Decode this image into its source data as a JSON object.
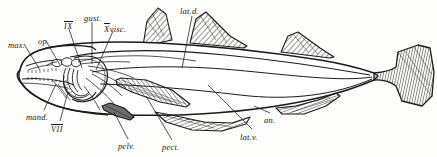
{
  "figure": {
    "background_color": "#fdfdfc",
    "ink_color": "#181818",
    "hatch_color": "#4a4a4a"
  },
  "labels": [
    {
      "id": "max",
      "text": "max.",
      "x": 8,
      "y": 41,
      "style": "plain"
    },
    {
      "id": "op",
      "text": "op.",
      "x": 38,
      "y": 37,
      "style": "plain"
    },
    {
      "id": "nerve-ix",
      "text": "IX",
      "x": 64,
      "y": 21,
      "style": "roman"
    },
    {
      "id": "gust",
      "text": "gust.",
      "x": 84,
      "y": 14,
      "style": "plain"
    },
    {
      "id": "x-visc",
      "text": "visc.",
      "x": 106,
      "y": 23,
      "style": "roman-x",
      "prefix": "X"
    },
    {
      "id": "lat-d",
      "text": "lat.d.",
      "x": 180,
      "y": 7,
      "style": "plain"
    },
    {
      "id": "mand",
      "text": "mand.",
      "x": 26,
      "y": 113,
      "style": "plain"
    },
    {
      "id": "nerve-vii",
      "text": "VII",
      "x": 51,
      "y": 124,
      "style": "roman"
    },
    {
      "id": "pelv",
      "text": "pelv.",
      "x": 118,
      "y": 142,
      "style": "plain"
    },
    {
      "id": "pect",
      "text": "pect.",
      "x": 162,
      "y": 143,
      "style": "plain"
    },
    {
      "id": "lat-v",
      "text": "lat.v.",
      "x": 240,
      "y": 133,
      "style": "plain"
    },
    {
      "id": "an",
      "text": "an.",
      "x": 264,
      "y": 116,
      "style": "plain"
    }
  ],
  "anatomy_parts": [
    {
      "key": "max",
      "name": "maxilla"
    },
    {
      "key": "op",
      "name": "operculum"
    },
    {
      "key": "IX",
      "name": "glossopharyngeal nerve"
    },
    {
      "key": "gust",
      "name": "gustatory branch"
    },
    {
      "key": "Xvisc",
      "name": "vagus visceral branch"
    },
    {
      "key": "lat.d",
      "name": "dorsal lateral line nerve"
    },
    {
      "key": "mand",
      "name": "mandible"
    },
    {
      "key": "VII",
      "name": "facial nerve"
    },
    {
      "key": "pelv",
      "name": "pelvic fin"
    },
    {
      "key": "pect",
      "name": "pectoral fin"
    },
    {
      "key": "lat.v",
      "name": "ventral lateral line nerve"
    },
    {
      "key": "an",
      "name": "anal fin"
    }
  ],
  "fins": {
    "dorsal_count": 3,
    "anal_count": 2,
    "has_caudal": true,
    "has_pectoral": true,
    "has_pelvic": true
  }
}
